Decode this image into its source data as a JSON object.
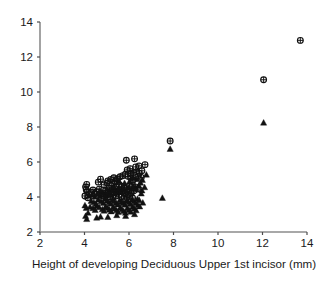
{
  "chart_data": {
    "type": "scatter",
    "title": "",
    "xlabel": "Height of developing Deciduous Upper 1st incisor (mm)",
    "ylabel": "",
    "xlim": [
      2,
      14
    ],
    "ylim": [
      2,
      14
    ],
    "xticks": [
      2,
      4,
      6,
      8,
      10,
      12,
      14
    ],
    "yticks": [
      2,
      4,
      6,
      8,
      10,
      12,
      14
    ],
    "xtick_labels": [
      "2",
      "4",
      "6",
      "8",
      "10",
      "12",
      "14"
    ],
    "ytick_labels": [
      "2",
      "4",
      "6",
      "8",
      "10",
      "12",
      "14"
    ],
    "grid": false,
    "legend": "none",
    "axis_color": "#8c8c8c",
    "marker_color": "#111111",
    "series": [
      {
        "name": "circle-cross",
        "marker": "circle-plus",
        "points": [
          [
            13.7,
            12.95
          ],
          [
            12.05,
            10.7
          ],
          [
            7.85,
            7.2
          ],
          [
            6.25,
            6.18
          ],
          [
            5.88,
            6.1
          ],
          [
            6.72,
            5.85
          ],
          [
            6.45,
            5.78
          ],
          [
            6.3,
            5.72
          ],
          [
            6.05,
            5.62
          ],
          [
            5.92,
            5.55
          ],
          [
            6.55,
            5.12
          ],
          [
            6.4,
            5.18
          ],
          [
            4.72,
            5.02
          ],
          [
            4.1,
            4.72
          ],
          [
            4.05,
            4.58
          ],
          [
            4.08,
            4.42
          ],
          [
            4.12,
            4.3
          ],
          [
            4.02,
            4.06
          ],
          [
            4.15,
            3.96
          ],
          [
            4.62,
            4.85
          ],
          [
            4.88,
            4.7
          ],
          [
            5.02,
            4.8
          ],
          [
            5.22,
            4.66
          ],
          [
            5.35,
            4.88
          ],
          [
            5.48,
            5.04
          ],
          [
            5.6,
            5.16
          ],
          [
            5.72,
            5.22
          ],
          [
            5.84,
            5.3
          ],
          [
            5.95,
            5.18
          ],
          [
            6.08,
            5.08
          ],
          [
            6.18,
            4.96
          ],
          [
            5.1,
            4.52
          ],
          [
            5.25,
            4.44
          ],
          [
            5.4,
            4.58
          ],
          [
            5.55,
            4.72
          ],
          [
            5.68,
            4.62
          ],
          [
            5.8,
            4.5
          ],
          [
            5.92,
            4.42
          ],
          [
            6.02,
            4.62
          ],
          [
            6.15,
            4.7
          ],
          [
            6.28,
            4.58
          ],
          [
            6.38,
            4.46
          ],
          [
            4.95,
            4.35
          ],
          [
            5.08,
            4.28
          ],
          [
            5.18,
            4.18
          ],
          [
            5.3,
            4.26
          ],
          [
            5.44,
            4.34
          ],
          [
            5.58,
            4.4
          ],
          [
            5.7,
            4.3
          ],
          [
            5.82,
            4.2
          ],
          [
            5.96,
            4.12
          ],
          [
            6.1,
            4.24
          ],
          [
            6.22,
            4.36
          ],
          [
            4.78,
            4.2
          ],
          [
            4.85,
            4.05
          ],
          [
            5.0,
            4.1
          ],
          [
            5.14,
            4.02
          ],
          [
            5.28,
            3.96
          ],
          [
            5.42,
            4.06
          ],
          [
            5.56,
            4.14
          ],
          [
            5.66,
            4.0
          ],
          [
            5.78,
            3.92
          ],
          [
            5.9,
            3.98
          ],
          [
            6.04,
            4.04
          ],
          [
            6.16,
            3.94
          ],
          [
            4.66,
            4.45
          ],
          [
            4.55,
            4.3
          ],
          [
            4.45,
            4.18
          ],
          [
            4.38,
            4.4
          ],
          [
            4.3,
            4.28
          ],
          [
            5.05,
            4.92
          ],
          [
            5.18,
            5.0
          ],
          [
            5.32,
            5.1
          ],
          [
            5.46,
            4.94
          ],
          [
            6.46,
            5.36
          ],
          [
            6.34,
            5.44
          ],
          [
            6.58,
            5.5
          ],
          [
            6.2,
            5.4
          ],
          [
            6.06,
            5.34
          ]
        ]
      },
      {
        "name": "filled-triangle",
        "marker": "triangle-up",
        "points": [
          [
            12.05,
            8.25
          ],
          [
            7.85,
            6.75
          ],
          [
            7.5,
            3.95
          ],
          [
            6.78,
            5.28
          ],
          [
            6.58,
            4.38
          ],
          [
            6.62,
            3.68
          ],
          [
            4.02,
            3.52
          ],
          [
            4.08,
            3.38
          ],
          [
            4.05,
            2.92
          ],
          [
            4.1,
            2.74
          ],
          [
            4.25,
            3.44
          ],
          [
            4.38,
            3.36
          ],
          [
            4.48,
            3.26
          ],
          [
            4.55,
            3.5
          ],
          [
            4.66,
            3.42
          ],
          [
            4.72,
            2.88
          ],
          [
            4.8,
            3.3
          ],
          [
            4.88,
            3.22
          ],
          [
            4.95,
            3.46
          ],
          [
            5.04,
            3.38
          ],
          [
            5.12,
            3.28
          ],
          [
            5.2,
            3.18
          ],
          [
            5.28,
            3.42
          ],
          [
            5.36,
            3.34
          ],
          [
            5.44,
            3.24
          ],
          [
            5.52,
            3.14
          ],
          [
            5.6,
            3.4
          ],
          [
            5.68,
            3.3
          ],
          [
            5.76,
            3.2
          ],
          [
            5.84,
            3.1
          ],
          [
            5.92,
            3.36
          ],
          [
            6.0,
            3.26
          ],
          [
            6.08,
            3.16
          ],
          [
            6.16,
            3.44
          ],
          [
            6.24,
            3.34
          ],
          [
            6.32,
            3.24
          ],
          [
            6.4,
            3.54
          ],
          [
            6.48,
            3.46
          ],
          [
            4.3,
            3.78
          ],
          [
            4.42,
            3.7
          ],
          [
            4.52,
            3.62
          ],
          [
            4.62,
            3.86
          ],
          [
            4.74,
            3.76
          ],
          [
            4.84,
            3.66
          ],
          [
            4.92,
            3.9
          ],
          [
            5.02,
            3.8
          ],
          [
            5.1,
            3.7
          ],
          [
            5.18,
            3.62
          ],
          [
            5.26,
            3.86
          ],
          [
            5.34,
            3.76
          ],
          [
            5.42,
            3.66
          ],
          [
            5.5,
            3.58
          ],
          [
            5.58,
            3.82
          ],
          [
            5.66,
            3.72
          ],
          [
            5.74,
            3.64
          ],
          [
            5.82,
            3.56
          ],
          [
            5.9,
            3.8
          ],
          [
            5.98,
            3.7
          ],
          [
            6.06,
            3.6
          ],
          [
            6.14,
            3.86
          ],
          [
            6.22,
            3.76
          ],
          [
            6.3,
            3.66
          ],
          [
            6.38,
            3.9
          ],
          [
            6.46,
            3.82
          ],
          [
            4.2,
            4.08
          ],
          [
            4.34,
            4.14
          ],
          [
            4.46,
            4.02
          ],
          [
            4.58,
            4.16
          ],
          [
            4.7,
            4.06
          ],
          [
            4.82,
            4.22
          ],
          [
            4.94,
            4.12
          ],
          [
            5.06,
            4.26
          ],
          [
            5.16,
            4.16
          ],
          [
            5.24,
            4.34
          ],
          [
            5.38,
            4.24
          ],
          [
            5.5,
            4.42
          ],
          [
            5.62,
            4.32
          ],
          [
            5.74,
            4.48
          ],
          [
            5.86,
            4.38
          ],
          [
            5.98,
            4.54
          ],
          [
            6.1,
            4.44
          ],
          [
            6.2,
            4.6
          ],
          [
            6.32,
            4.5
          ],
          [
            6.44,
            4.66
          ],
          [
            6.52,
            4.82
          ],
          [
            6.6,
            4.98
          ],
          [
            4.16,
            3.1
          ],
          [
            4.55,
            2.82
          ],
          [
            5.05,
            2.86
          ],
          [
            5.45,
            2.96
          ],
          [
            5.85,
            2.92
          ],
          [
            6.25,
            3.02
          ],
          [
            6.55,
            4.2
          ],
          [
            6.7,
            4.56
          ],
          [
            6.35,
            5.02
          ],
          [
            6.18,
            5.12
          ],
          [
            6.02,
            4.88
          ],
          [
            5.8,
            4.8
          ],
          [
            5.55,
            4.9
          ],
          [
            5.3,
            4.6
          ],
          [
            5.0,
            4.48
          ],
          [
            4.7,
            4.38
          ]
        ]
      }
    ]
  },
  "plot_geometry": {
    "left": 40,
    "right": 307,
    "top": 22,
    "bottom": 232
  }
}
